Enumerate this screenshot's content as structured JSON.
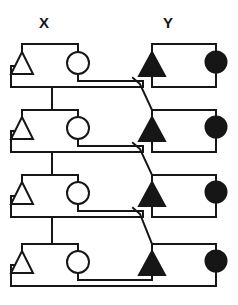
{
  "diagram": {
    "type": "schematic",
    "background_color": "#ffffff",
    "line_color": "#161616",
    "fill_color": "#161616",
    "open_fill_color": "#ffffff",
    "stroke_width": 2,
    "labels": {
      "left_column": "X",
      "right_column": "Y"
    },
    "stage_count": 4,
    "symbol_legend": [
      {
        "key": "open-triangle",
        "glyph": "open-triangle-up",
        "filled": false,
        "column": "X"
      },
      {
        "key": "open-circle",
        "glyph": "open-circle",
        "filled": false,
        "column": "X"
      },
      {
        "key": "filled-triangle",
        "glyph": "filled-triangle-up",
        "filled": true,
        "column": "Y"
      },
      {
        "key": "filled-circle",
        "glyph": "filled-circle",
        "filled": true,
        "column": "Y"
      }
    ],
    "stages": [
      {
        "index": 1,
        "row_top_y": 44,
        "row_mid_y": 66,
        "row_bot_y": 87,
        "elements": [
          {
            "name": "open-triangle",
            "x": 22,
            "y": 66
          },
          {
            "name": "open-circle",
            "x": 78,
            "y": 63
          },
          {
            "name": "filled-triangle",
            "x": 152,
            "y": 66
          },
          {
            "name": "filled-circle",
            "x": 216,
            "y": 62
          }
        ]
      },
      {
        "index": 2,
        "row_top_y": 110,
        "row_mid_y": 131,
        "row_bot_y": 152,
        "elements": [
          {
            "name": "open-triangle",
            "x": 22,
            "y": 131
          },
          {
            "name": "open-circle",
            "x": 78,
            "y": 128
          },
          {
            "name": "filled-triangle",
            "x": 152,
            "y": 131
          },
          {
            "name": "filled-circle",
            "x": 216,
            "y": 127
          }
        ]
      },
      {
        "index": 3,
        "row_top_y": 175,
        "row_mid_y": 196,
        "row_bot_y": 217,
        "elements": [
          {
            "name": "open-triangle",
            "x": 22,
            "y": 196
          },
          {
            "name": "open-circle",
            "x": 78,
            "y": 193
          },
          {
            "name": "filled-triangle",
            "x": 152,
            "y": 196
          },
          {
            "name": "filled-circle",
            "x": 216,
            "y": 192
          }
        ]
      },
      {
        "index": 4,
        "row_top_y": 244,
        "row_mid_y": 265,
        "row_bot_y": 286,
        "elements": [
          {
            "name": "open-triangle",
            "x": 22,
            "y": 265
          },
          {
            "name": "open-circle",
            "x": 78,
            "y": 262
          },
          {
            "name": "filled-triangle",
            "x": 152,
            "y": 265
          },
          {
            "name": "filled-circle",
            "x": 216,
            "y": 261
          }
        ]
      }
    ],
    "interconnects": [
      {
        "from_stage": 1,
        "to_stage": 2,
        "kind": "vertical-left-bus",
        "x": 52
      },
      {
        "from_stage": 2,
        "to_stage": 3,
        "kind": "vertical-left-bus",
        "x": 52
      },
      {
        "from_stage": 3,
        "to_stage": 4,
        "kind": "vertical-left-bus",
        "x": 52
      },
      {
        "from_stage": 1,
        "to_stage": 2,
        "kind": "diagonal-crossover",
        "hop": true
      },
      {
        "from_stage": 2,
        "to_stage": 3,
        "kind": "diagonal-crossover",
        "hop": true
      },
      {
        "from_stage": 3,
        "to_stage": 4,
        "kind": "diagonal-crossover",
        "hop": true
      },
      {
        "from_stage": 4,
        "to_stage": 4,
        "kind": "bottom-return-bus"
      }
    ]
  }
}
